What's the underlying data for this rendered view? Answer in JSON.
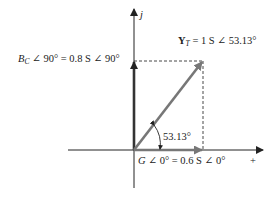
{
  "diagram": {
    "type": "admittance-phasor-diagram",
    "axes": {
      "imag_label": "j",
      "real_label": "+"
    },
    "vectors": {
      "G": {
        "magnitude": 0.6,
        "unit": "S",
        "angle_deg": 0
      },
      "B_C": {
        "magnitude": 0.8,
        "unit": "S",
        "angle_deg": 90
      },
      "Y_T": {
        "magnitude": 1,
        "unit": "S",
        "angle_deg": 53.13
      }
    },
    "labels": {
      "bc_sym": "B",
      "bc_sub": "C",
      "bc_rest": " ∠ 90°  =  0.8 S ∠ 90°",
      "yt_sym": "Y",
      "yt_sub": "T",
      "yt_rest": "  =  1 S ∠ 53.13°",
      "g_sym": "G",
      "g_rest": " ∠ 0°  =  0.6 S ∠ 0°",
      "angle": "53.13°"
    },
    "colors": {
      "axis": "#222222",
      "bc_vector": "#333333",
      "g_vector": "#777777",
      "yt_vector": "#777777",
      "dashed": "#333333"
    }
  }
}
